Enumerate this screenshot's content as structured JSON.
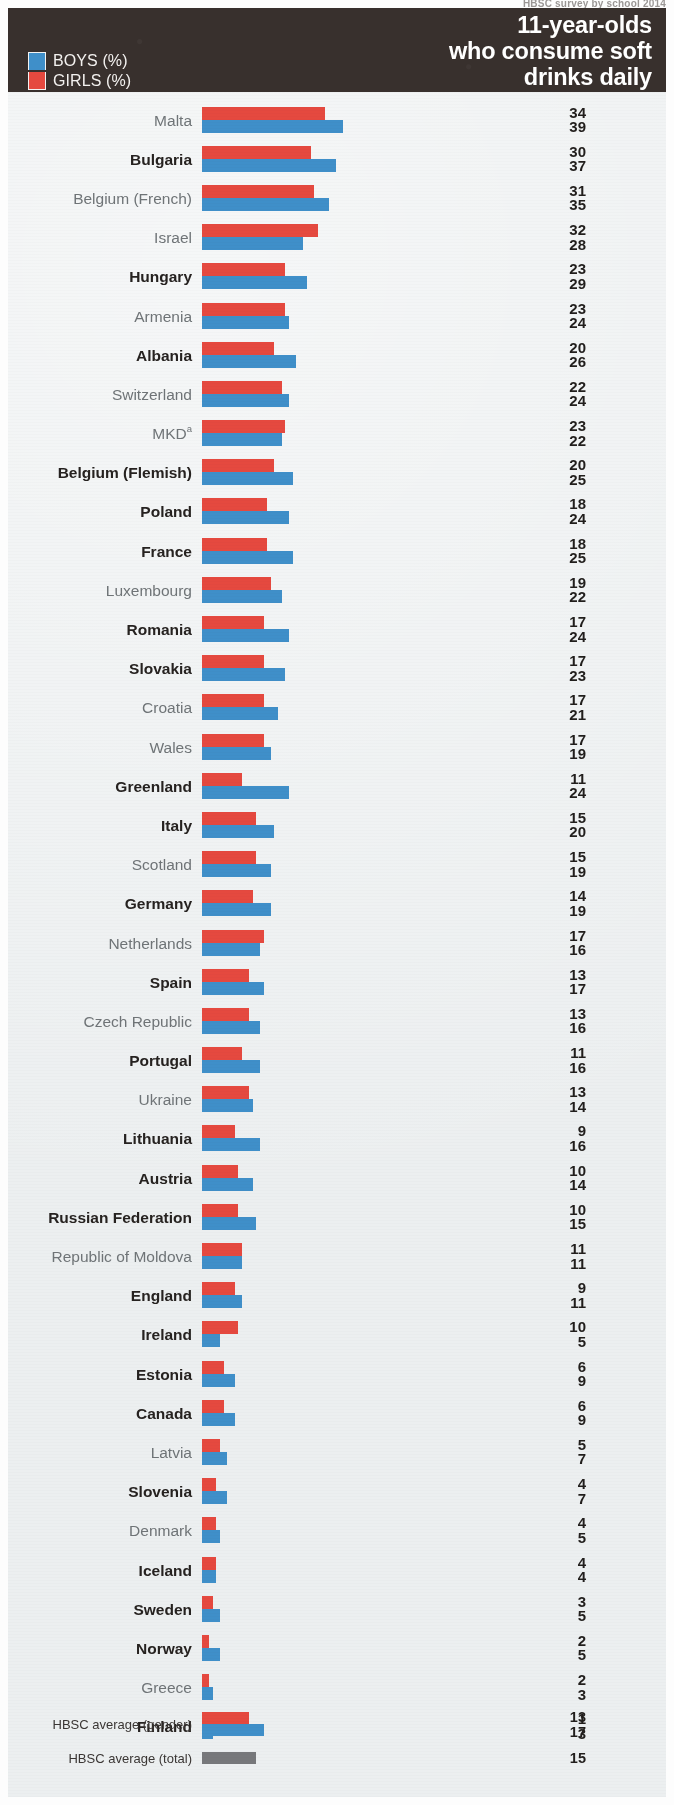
{
  "top_caption": "HBSC survey by school 2014",
  "header": {
    "title": "11-year-olds\nwho consume soft\ndrinks daily",
    "legend": [
      {
        "key": "boys",
        "label": "BOYS (%)",
        "color": "#3f8fc9"
      },
      {
        "key": "girls",
        "label": "GIRLS (%)",
        "color": "#e5493f"
      }
    ]
  },
  "chart_data": {
    "type": "bar",
    "orientation": "horizontal",
    "title": "11-year-olds who consume soft drinks daily",
    "xlabel": "",
    "ylabel": "",
    "xlim": [
      0,
      40
    ],
    "grid": false,
    "legend_position": "top-left",
    "colors": {
      "boys": "#3f8fc9",
      "girls": "#e5493f",
      "total": "#77787b"
    },
    "categories": [
      "Malta",
      "Bulgaria",
      "Belgium (French)",
      "Israel",
      "Hungary",
      "Armenia",
      "Albania",
      "Switzerland",
      "MKD",
      "Belgium (Flemish)",
      "Poland",
      "France",
      "Luxembourg",
      "Romania",
      "Slovakia",
      "Croatia",
      "Wales",
      "Greenland",
      "Italy",
      "Scotland",
      "Germany",
      "Netherlands",
      "Spain",
      "Czech Republic",
      "Portugal",
      "Ukraine",
      "Lithuania",
      "Austria",
      "Russian Federation",
      "Republic of Moldova",
      "England",
      "Ireland",
      "Estonia",
      "Canada",
      "Latvia",
      "Slovenia",
      "Denmark",
      "Iceland",
      "Sweden",
      "Norway",
      "Greece",
      "Finland"
    ],
    "series": [
      {
        "name": "GIRLS (%)",
        "values": [
          34,
          30,
          31,
          32,
          23,
          23,
          20,
          22,
          23,
          20,
          18,
          18,
          19,
          17,
          17,
          17,
          17,
          11,
          15,
          15,
          14,
          17,
          13,
          13,
          11,
          13,
          9,
          10,
          10,
          11,
          9,
          10,
          6,
          6,
          5,
          4,
          4,
          4,
          3,
          2,
          2,
          1
        ]
      },
      {
        "name": "BOYS (%)",
        "values": [
          39,
          37,
          35,
          28,
          29,
          24,
          26,
          24,
          22,
          25,
          24,
          25,
          22,
          24,
          23,
          21,
          19,
          24,
          20,
          19,
          19,
          16,
          17,
          16,
          16,
          14,
          16,
          14,
          15,
          11,
          11,
          5,
          9,
          9,
          7,
          7,
          5,
          4,
          5,
          5,
          3,
          3
        ]
      }
    ],
    "averages": [
      {
        "label": "HBSC average (gender)",
        "girls": 13,
        "boys": 17
      },
      {
        "label": "HBSC average (total)",
        "total": 15
      }
    ]
  },
  "rows": [
    {
      "label": "Malta",
      "sup": "",
      "bold": false,
      "girls": 34,
      "boys": 39
    },
    {
      "label": "Bulgaria",
      "sup": "",
      "bold": true,
      "girls": 30,
      "boys": 37
    },
    {
      "label": "Belgium (French)",
      "sup": "",
      "bold": false,
      "girls": 31,
      "boys": 35
    },
    {
      "label": "Israel",
      "sup": "",
      "bold": false,
      "girls": 32,
      "boys": 28
    },
    {
      "label": "Hungary",
      "sup": "",
      "bold": true,
      "girls": 23,
      "boys": 29
    },
    {
      "label": "Armenia",
      "sup": "",
      "bold": false,
      "girls": 23,
      "boys": 24
    },
    {
      "label": "Albania",
      "sup": "",
      "bold": true,
      "girls": 20,
      "boys": 26
    },
    {
      "label": "Switzerland",
      "sup": "",
      "bold": false,
      "girls": 22,
      "boys": 24
    },
    {
      "label": "MKD",
      "sup": "a",
      "bold": false,
      "girls": 23,
      "boys": 22
    },
    {
      "label": "Belgium (Flemish)",
      "sup": "",
      "bold": true,
      "girls": 20,
      "boys": 25
    },
    {
      "label": "Poland",
      "sup": "",
      "bold": true,
      "girls": 18,
      "boys": 24
    },
    {
      "label": "France",
      "sup": "",
      "bold": true,
      "girls": 18,
      "boys": 25
    },
    {
      "label": "Luxembourg",
      "sup": "",
      "bold": false,
      "girls": 19,
      "boys": 22
    },
    {
      "label": "Romania",
      "sup": "",
      "bold": true,
      "girls": 17,
      "boys": 24
    },
    {
      "label": "Slovakia",
      "sup": "",
      "bold": true,
      "girls": 17,
      "boys": 23
    },
    {
      "label": "Croatia",
      "sup": "",
      "bold": false,
      "girls": 17,
      "boys": 21
    },
    {
      "label": "Wales",
      "sup": "",
      "bold": false,
      "girls": 17,
      "boys": 19
    },
    {
      "label": "Greenland",
      "sup": "",
      "bold": true,
      "girls": 11,
      "boys": 24
    },
    {
      "label": "Italy",
      "sup": "",
      "bold": true,
      "girls": 15,
      "boys": 20
    },
    {
      "label": "Scotland",
      "sup": "",
      "bold": false,
      "girls": 15,
      "boys": 19
    },
    {
      "label": "Germany",
      "sup": "",
      "bold": true,
      "girls": 14,
      "boys": 19
    },
    {
      "label": "Netherlands",
      "sup": "",
      "bold": false,
      "girls": 17,
      "boys": 16
    },
    {
      "label": "Spain",
      "sup": "",
      "bold": true,
      "girls": 13,
      "boys": 17
    },
    {
      "label": "Czech Republic",
      "sup": "",
      "bold": false,
      "girls": 13,
      "boys": 16
    },
    {
      "label": "Portugal",
      "sup": "",
      "bold": true,
      "girls": 11,
      "boys": 16
    },
    {
      "label": "Ukraine",
      "sup": "",
      "bold": false,
      "girls": 13,
      "boys": 14
    },
    {
      "label": "Lithuania",
      "sup": "",
      "bold": true,
      "girls": 9,
      "boys": 16
    },
    {
      "label": "Austria",
      "sup": "",
      "bold": true,
      "girls": 10,
      "boys": 14
    },
    {
      "label": "Russian Federation",
      "sup": "",
      "bold": true,
      "girls": 10,
      "boys": 15
    },
    {
      "label": "Republic of Moldova",
      "sup": "",
      "bold": false,
      "girls": 11,
      "boys": 11
    },
    {
      "label": "England",
      "sup": "",
      "bold": true,
      "girls": 9,
      "boys": 11
    },
    {
      "label": "Ireland",
      "sup": "",
      "bold": true,
      "girls": 10,
      "boys": 5
    },
    {
      "label": "Estonia",
      "sup": "",
      "bold": true,
      "girls": 6,
      "boys": 9
    },
    {
      "label": "Canada",
      "sup": "",
      "bold": true,
      "girls": 6,
      "boys": 9
    },
    {
      "label": "Latvia",
      "sup": "",
      "bold": false,
      "girls": 5,
      "boys": 7
    },
    {
      "label": "Slovenia",
      "sup": "",
      "bold": true,
      "girls": 4,
      "boys": 7
    },
    {
      "label": "Denmark",
      "sup": "",
      "bold": false,
      "girls": 4,
      "boys": 5
    },
    {
      "label": "Iceland",
      "sup": "",
      "bold": true,
      "girls": 4,
      "boys": 4
    },
    {
      "label": "Sweden",
      "sup": "",
      "bold": true,
      "girls": 3,
      "boys": 5
    },
    {
      "label": "Norway",
      "sup": "",
      "bold": true,
      "girls": 2,
      "boys": 5
    },
    {
      "label": "Greece",
      "sup": "",
      "bold": false,
      "girls": 2,
      "boys": 3
    },
    {
      "label": "Finland",
      "sup": "",
      "bold": true,
      "girls": 1,
      "boys": 3
    }
  ],
  "averages": {
    "gender": {
      "label": "HBSC average (gender)",
      "girls": 13,
      "boys": 17
    },
    "total": {
      "label": "HBSC average (total)",
      "value": 15
    }
  },
  "scale_px_per_unit": 3.62
}
